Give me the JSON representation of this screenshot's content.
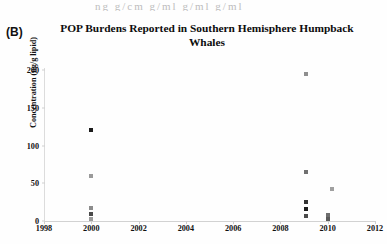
{
  "panel": {
    "label": "(B)",
    "cutoff_text_above": "ng   g/cm   g/ml   g/ml   g/ml"
  },
  "chart_data": {
    "type": "scatter",
    "title": "POP Burdens Reported in Southern Hemisphere Humpback Whales",
    "title_line1": "POP Burdens Reported in Southern Hemisphere Humpback",
    "title_line2": "Whales",
    "xlabel": "",
    "ylabel": "Concentration (ng/g lipid)",
    "xlim": [
      1998,
      2012
    ],
    "ylim": [
      0,
      200
    ],
    "xticks": [
      1998,
      2000,
      2002,
      2004,
      2006,
      2008,
      2010,
      2012
    ],
    "yticks": [
      0,
      50,
      100,
      150,
      200
    ],
    "grid": false,
    "legend": "none",
    "marker": "square",
    "points": [
      {
        "x": 2000.0,
        "y": 120,
        "color": "#1c1c1c"
      },
      {
        "x": 2000.0,
        "y": 60,
        "color": "#9a9a9a"
      },
      {
        "x": 2000.0,
        "y": 17,
        "color": "#8c8c8c"
      },
      {
        "x": 2000.0,
        "y": 9,
        "color": "#4a4a4a"
      },
      {
        "x": 2000.0,
        "y": 2,
        "color": "#9a9a9a"
      },
      {
        "x": 2009.1,
        "y": 195,
        "color": "#8f8f8f"
      },
      {
        "x": 2009.1,
        "y": 65,
        "color": "#707070"
      },
      {
        "x": 2009.1,
        "y": 25,
        "color": "#333333"
      },
      {
        "x": 2009.1,
        "y": 16,
        "color": "#1c1c1c"
      },
      {
        "x": 2009.1,
        "y": 7,
        "color": "#4a4a4a"
      },
      {
        "x": 2010.2,
        "y": 42,
        "color": "#a0a0a0"
      },
      {
        "x": 2010.0,
        "y": 8,
        "color": "#6e6e6e"
      },
      {
        "x": 2010.0,
        "y": 3,
        "color": "#5a5a5a"
      }
    ]
  }
}
